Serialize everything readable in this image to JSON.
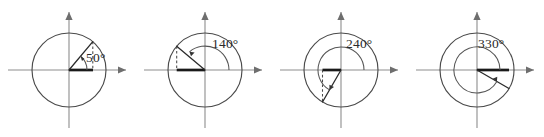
{
  "figure": {
    "kind": "unit-circle-angle-diagrams",
    "panel_count": 4,
    "background_color": "#ffffff",
    "axis_color": "#8d8d8d",
    "circle_color": "#4a4a4a",
    "ray_color": "#2b2b2b",
    "reference_segment_color": "#1a1a1a",
    "dashed_color": "#4a4a4a",
    "label_color": "#2a2a2a"
  },
  "panels": [
    {
      "id": "panel-50",
      "angle_label": "50°",
      "angle_value": 50,
      "quadrant": 1,
      "reference_angle": 50,
      "has_drop_dashed": true,
      "drop_side": "right",
      "ref_segment_side": "positive-x",
      "sweep_direction": "counterclockwise",
      "label_x": 86,
      "label_y": 62
    },
    {
      "id": "panel-140",
      "angle_label": "140°",
      "angle_value": 140,
      "quadrant": 2,
      "reference_angle": 40,
      "has_drop_dashed": true,
      "drop_side": "left",
      "ref_segment_side": "negative-x",
      "sweep_direction": "counterclockwise",
      "label_x": 76,
      "label_y": 48
    },
    {
      "id": "panel-240",
      "angle_label": "240°",
      "angle_value": 240,
      "quadrant": 3,
      "reference_angle": 60,
      "has_drop_dashed": true,
      "drop_side": "left",
      "ref_segment_side": "negative-x",
      "sweep_direction": "counterclockwise",
      "label_x": 74,
      "label_y": 48
    },
    {
      "id": "panel-330",
      "angle_label": "330°",
      "angle_value": 330,
      "quadrant": 4,
      "reference_angle": 30,
      "has_drop_dashed": false,
      "drop_side": "none",
      "ref_segment_side": "positive-x",
      "sweep_direction": "counterclockwise",
      "label_x": 70,
      "label_y": 48
    }
  ]
}
